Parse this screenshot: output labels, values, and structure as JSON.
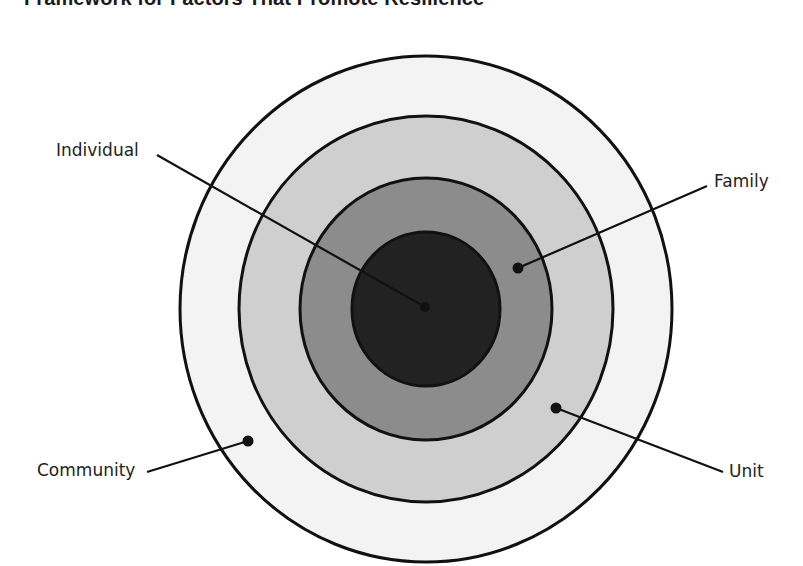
{
  "title": "Framework for Factors That Promote Resilience",
  "diagram": {
    "type": "concentric-circles",
    "center": [
      426,
      309
    ],
    "rings": [
      {
        "name": "Community",
        "rx": 246,
        "ry": 253,
        "fill": "#f3f3f3"
      },
      {
        "name": "Unit",
        "rx": 187,
        "ry": 193,
        "fill": "#cfcfcf"
      },
      {
        "name": "Family",
        "rx": 126,
        "ry": 131,
        "fill": "#8c8c8c"
      },
      {
        "name": "Individual",
        "rx": 74,
        "ry": 77,
        "fill": "#222222"
      }
    ],
    "stroke_color": "#111111",
    "labels": {
      "individual": "Individual",
      "family": "Family",
      "community": "Community",
      "unit": "Unit"
    }
  }
}
